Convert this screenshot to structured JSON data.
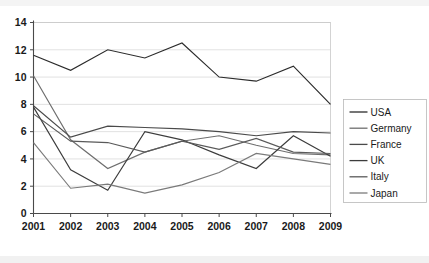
{
  "chart_data": {
    "type": "line",
    "title": "",
    "xlabel": "",
    "ylabel": "",
    "x": [
      2001,
      2002,
      2003,
      2004,
      2005,
      2006,
      2007,
      2008,
      2009
    ],
    "categories": [
      "2001",
      "2002",
      "2003",
      "2004",
      "2005",
      "2006",
      "2007",
      "2008",
      "2009"
    ],
    "xlim": [
      2001,
      2009
    ],
    "ylim": [
      0,
      14
    ],
    "yticks": [
      0,
      2,
      4,
      6,
      8,
      10,
      12,
      14
    ],
    "ytick_labels": [
      "0",
      "2",
      "4",
      "6",
      "8",
      "10",
      "12",
      "14"
    ],
    "grid": true,
    "legend_position": "right",
    "series": [
      {
        "name": "USA",
        "color": "#2b2b2b",
        "values": [
          11.6,
          10.5,
          12.0,
          11.4,
          12.5,
          10.0,
          9.7,
          10.8,
          8.0
        ]
      },
      {
        "name": "Germany",
        "color": "#6e6e6e",
        "values": [
          10.1,
          5.4,
          3.3,
          4.5,
          5.3,
          5.7,
          5.0,
          4.4,
          4.3
        ]
      },
      {
        "name": "France",
        "color": "#4a4a4a",
        "values": [
          7.9,
          5.6,
          6.4,
          6.3,
          6.2,
          6.0,
          5.7,
          6.0,
          5.9
        ]
      },
      {
        "name": "UK",
        "color": "#3c3c3c",
        "values": [
          7.8,
          3.2,
          1.7,
          6.0,
          5.4,
          4.3,
          3.3,
          5.7,
          4.2
        ]
      },
      {
        "name": "Italy",
        "color": "#5a5a5a",
        "values": [
          7.3,
          5.3,
          5.2,
          4.5,
          5.3,
          4.7,
          5.5,
          4.5,
          4.4
        ]
      },
      {
        "name": "Japan",
        "color": "#7a7a7a",
        "values": [
          5.2,
          1.85,
          2.15,
          1.5,
          2.1,
          3.0,
          4.4,
          4.0,
          3.6
        ]
      }
    ]
  },
  "axes": {
    "y_labels": [
      "14",
      "12",
      "10",
      "8",
      "6",
      "4",
      "2",
      "0"
    ],
    "x_labels": [
      "2001",
      "2002",
      "2003",
      "2004",
      "2005",
      "2006",
      "2007",
      "2008",
      "2009"
    ]
  },
  "legend": {
    "entries": [
      {
        "label": "USA"
      },
      {
        "label": "Germany"
      },
      {
        "label": "France"
      },
      {
        "label": "UK"
      },
      {
        "label": "Italy"
      },
      {
        "label": "Japan"
      }
    ]
  }
}
